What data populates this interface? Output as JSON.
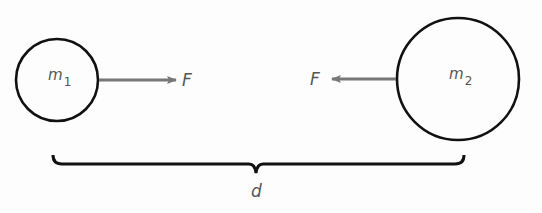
{
  "diagram": {
    "colors": {
      "outline": "#111111",
      "arrow": "#777777",
      "label": "#555555",
      "background": "#fdfdfd"
    },
    "mass1": {
      "symbol": "m",
      "subscript": "1",
      "cx": 57,
      "cy": 80,
      "r": 41
    },
    "mass2": {
      "symbol": "m",
      "subscript": "2",
      "cx": 458,
      "cy": 79,
      "r": 61
    },
    "force1": {
      "label": "F",
      "direction": "right",
      "x1": 99,
      "x2": 178,
      "y": 80
    },
    "force2": {
      "label": "F",
      "direction": "left",
      "x1": 397,
      "x2": 330,
      "y": 79
    },
    "distance": {
      "label": "d",
      "x1": 52,
      "x2": 465,
      "y": 163
    }
  }
}
